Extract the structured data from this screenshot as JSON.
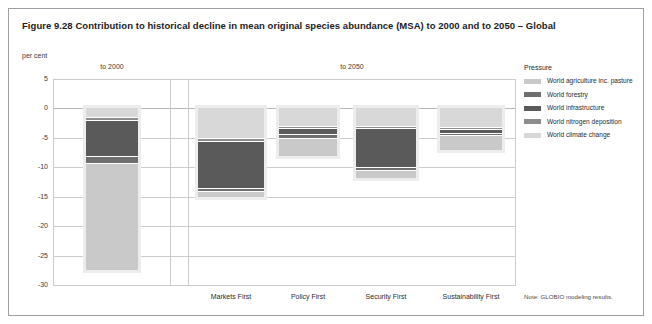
{
  "figure": {
    "title": "Figure 9.28 Contribution to historical decline in mean original species abundance (MSA) to 2000 and to 2050 – Global",
    "unit_label": "per cent",
    "note": "Note: GLOBIO modeling results."
  },
  "legend": {
    "title": "Pressure",
    "items": [
      {
        "label": "World agriculture inc. pasture",
        "color": "#c9c9c9"
      },
      {
        "label": "World forestry",
        "color": "#6e6e6e"
      },
      {
        "label": "World infrastructure",
        "color": "#5a5a5a"
      },
      {
        "label": "World nitrogen deposition",
        "color": "#8c8c8c"
      },
      {
        "label": "World climate change",
        "color": "#d8d8d8"
      }
    ]
  },
  "panels": [
    {
      "label": "to 2000"
    },
    {
      "label": "to 2050"
    }
  ],
  "chart_data": {
    "type": "bar",
    "title": "Figure 9.28 Contribution to historical decline in mean original species abundance (MSA) to 2000 and to 2050 – Global",
    "xlabel": "",
    "ylabel": "per cent",
    "ylim": [
      -30,
      5
    ],
    "yticks": [
      5,
      0,
      -5,
      -10,
      -15,
      -20,
      -25,
      -30
    ],
    "grid": true,
    "legend_position": "right",
    "stacked": true,
    "panels": [
      "to 2000",
      "to 2050"
    ],
    "categories": [
      "to 2000",
      "Markets First",
      "Policy First",
      "Security First",
      "Sustainability First"
    ],
    "series": [
      {
        "name": "World climate change",
        "color": "#d8d8d8",
        "values": [
          -1.5,
          -5.0,
          -3.0,
          -3.0,
          -3.2
        ]
      },
      {
        "name": "World nitrogen deposition",
        "color": "#8c8c8c",
        "values": [
          -0.4,
          -0.5,
          -0.4,
          -0.4,
          -0.3
        ]
      },
      {
        "name": "World infrastructure",
        "color": "#5a5a5a",
        "values": [
          -6.2,
          -8.0,
          -1.0,
          -6.5,
          -0.7
        ]
      },
      {
        "name": "World forestry",
        "color": "#6e6e6e",
        "values": [
          -1.1,
          -0.6,
          -0.6,
          -0.6,
          -0.4
        ]
      },
      {
        "name": "World agriculture inc. pasture",
        "color": "#c9c9c9",
        "values": [
          -18.3,
          -1.0,
          -3.0,
          -1.3,
          -2.4
        ]
      }
    ],
    "totals": [
      -27.5,
      -15.1,
      -8.0,
      -11.8,
      -7.0
    ]
  }
}
